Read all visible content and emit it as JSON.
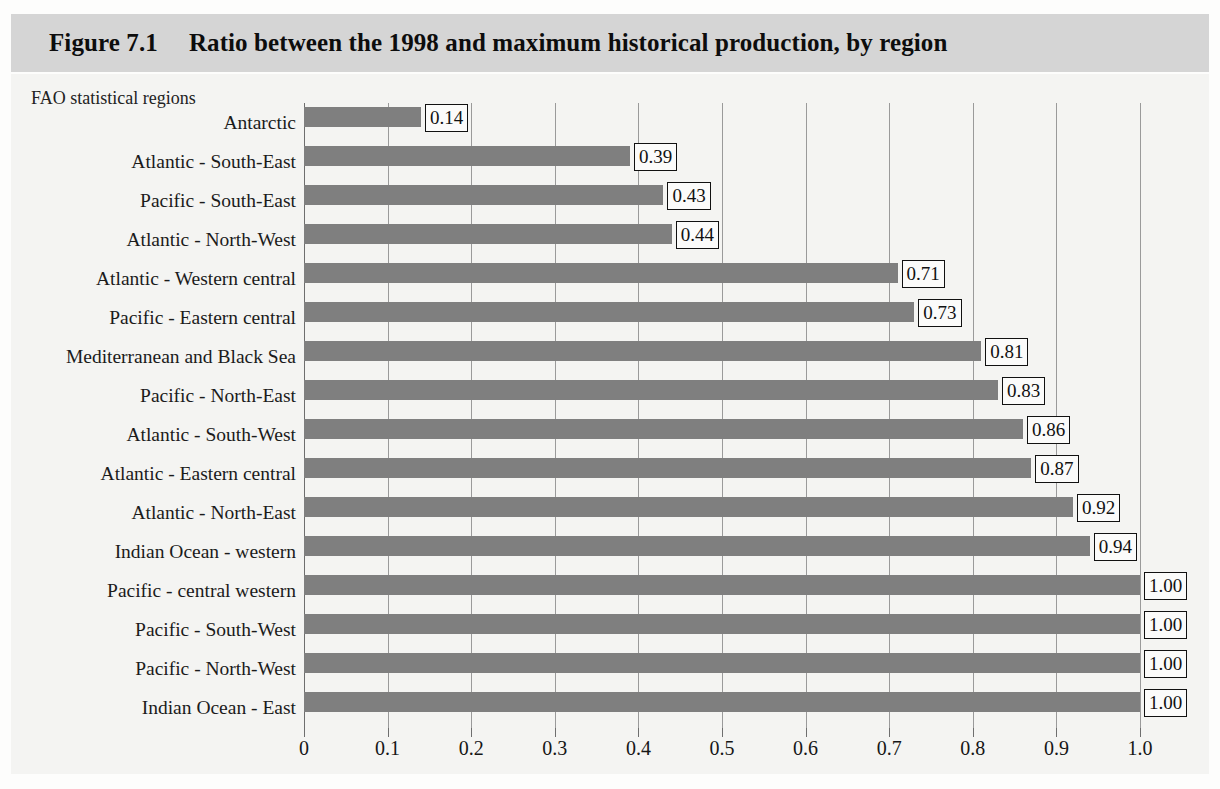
{
  "figure": {
    "number": "Figure 7.1",
    "title": "Ratio between the 1998 and maximum historical production, by region",
    "axis_caption": "FAO statistical regions",
    "band_color": "#d5d5d5",
    "bar_color": "#7f7f7f",
    "background_color": "#f4f4f2"
  },
  "chart_data": {
    "type": "bar",
    "orientation": "horizontal",
    "title": "Ratio between the 1998 and maximum historical production, by region",
    "xlabel": "",
    "ylabel": "FAO statistical regions",
    "xlim": [
      0,
      1.0
    ],
    "grid": true,
    "legend": null,
    "xticks": [
      0,
      0.1,
      0.2,
      0.3,
      0.4,
      0.5,
      0.6,
      0.7,
      0.8,
      0.9,
      1.0
    ],
    "xtick_labels": [
      "0",
      "0.1",
      "0.2",
      "0.3",
      "0.4",
      "0.5",
      "0.6",
      "0.7",
      "0.8",
      "0.9",
      "1.0"
    ],
    "categories": [
      "Antarctic",
      "Atlantic - South-East",
      "Pacific - South-East",
      "Atlantic - North-West",
      "Atlantic - Western central",
      "Pacific - Eastern central",
      "Mediterranean and Black Sea",
      "Pacific - North-East",
      "Atlantic - South-West",
      "Atlantic - Eastern central",
      "Atlantic - North-East",
      "Indian Ocean - western",
      "Pacific - central western",
      "Pacific - South-West",
      "Pacific - North-West",
      "Indian Ocean - East"
    ],
    "values": [
      0.14,
      0.39,
      0.43,
      0.44,
      0.71,
      0.73,
      0.81,
      0.83,
      0.86,
      0.87,
      0.92,
      0.94,
      1.0,
      1.0,
      1.0,
      1.0
    ],
    "data_labels": [
      "0.14",
      "0.39",
      "0.43",
      "0.44",
      "0.71",
      "0.73",
      "0.81",
      "0.83",
      "0.86",
      "0.87",
      "0.92",
      "0.94",
      "1.00",
      "1.00",
      "1.00",
      "1.00"
    ]
  }
}
